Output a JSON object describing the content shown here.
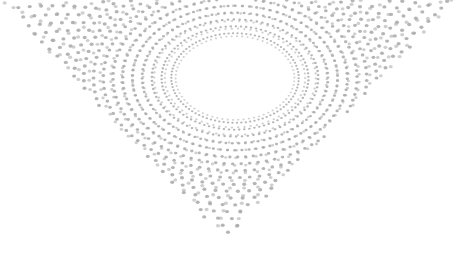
{
  "artwork": {
    "description": "Abstract halftone dot pattern forming a twisted inverted triangle with an elliptical void",
    "background": "#ffffff",
    "dot_color": "#a8a8a8",
    "hole": {
      "cx": 235,
      "cy": 78,
      "rx": 55,
      "ry": 38
    },
    "triangle": {
      "top_left": [
        0,
        0
      ],
      "top_right": [
        456,
        0
      ],
      "bottom": [
        225,
        240
      ]
    },
    "layers": [
      {
        "center": [
          235,
          78
        ],
        "rotation": 0,
        "rings": 26,
        "spokes": 90,
        "start_r": 40,
        "step": 7.2,
        "twist": 0.006
      },
      {
        "center": [
          235,
          78
        ],
        "rotation": 40,
        "rings": 22,
        "spokes": 70,
        "start_r": 44,
        "step": 8,
        "twist": -0.01
      }
    ]
  }
}
